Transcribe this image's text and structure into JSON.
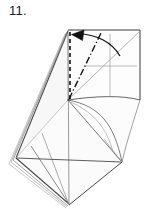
{
  "figure": {
    "step_number": "11.",
    "type": "origami-fold-diagram",
    "caption_position": "top-left",
    "colors": {
      "background": "#ffffff",
      "outline": "#3a3a3a",
      "thin_crease": "#8c8c8c",
      "layer_edge": "#6e6e6e",
      "fold_line": "#111111",
      "arrow": "#111111",
      "paper_fill": "#fdfdfd",
      "shaded_fill": "#f4f4f4",
      "label_text": "#1a1a1a"
    },
    "line_styles": {
      "valley_dashed": "dashed",
      "mountain_dash_dot": "dash-dot",
      "visible_edge": "solid",
      "hidden_crease": "thin-solid"
    }
  },
  "elements": {
    "step_label": "11.",
    "arrow_label": "fold-arrow",
    "square_panel_label": "top-right-square-panel",
    "dashed_fold_label": "vertical-valley-fold-line",
    "dash_dot_label": "mountain-fold-line",
    "layers_label": "stacked-paper-layers",
    "diamond_label": "lower-diamond-body",
    "flap_label": "curved-flap-edge"
  },
  "geometry": {
    "square_panel": {
      "top_left": [
        68,
        30
      ],
      "top_right": [
        140,
        30
      ],
      "bottom_right": [
        140,
        100
      ],
      "bottom_left": [
        68,
        100
      ]
    },
    "node_left_center": [
      68,
      100
    ],
    "apex_top": [
      68,
      30
    ],
    "diamond": {
      "left": [
        16,
        158
      ],
      "right": [
        122,
        162
      ],
      "bottom": [
        69,
        205
      ],
      "top_center": [
        68,
        100
      ]
    },
    "crosshair_center": [
      110,
      66
    ],
    "arrow": {
      "tip": [
        72,
        35
      ],
      "curve_end": [
        120,
        55
      ]
    }
  }
}
